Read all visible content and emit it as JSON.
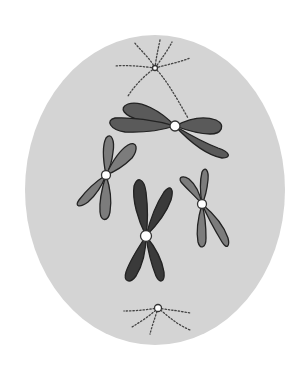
{
  "diagram": {
    "colors": {
      "background": "#ffffff",
      "cell": "#d4d4d4",
      "chromosome_dark": "#3a3a3a",
      "chromosome_mid": "#5a5a5a",
      "chromosome_light": "#7c7c7c",
      "centromere": "#ffffff",
      "spindle": "#444444"
    },
    "cell": {
      "cx": 155,
      "cy": 190,
      "rx": 130,
      "ry": 155
    },
    "centrosomes": [
      {
        "name": "upper-centrosome",
        "x": 155,
        "y": 68
      },
      {
        "name": "lower-centrosome",
        "x": 158,
        "y": 308
      }
    ],
    "chromosomes": [
      {
        "name": "chromosome-top-large",
        "centromere": [
          175,
          126
        ],
        "shade": "mid"
      },
      {
        "name": "chromosome-left",
        "centromere": [
          106,
          175
        ],
        "shade": "light"
      },
      {
        "name": "chromosome-center-dark",
        "centromere": [
          146,
          236
        ],
        "shade": "dark"
      },
      {
        "name": "chromosome-right",
        "centromere": [
          202,
          204
        ],
        "shade": "light"
      }
    ]
  }
}
